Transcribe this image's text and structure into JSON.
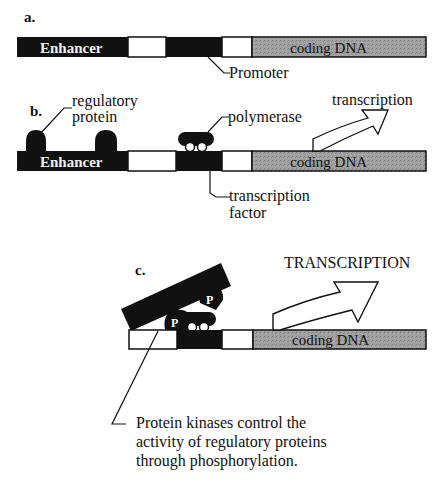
{
  "colors": {
    "dark": "#111111",
    "coding_gray": "#9a9a9a",
    "white": "#ffffff"
  },
  "panel_a": {
    "caption": "a.",
    "enhancer_label": "Enhancer",
    "coding_label": "coding DNA",
    "promoter_label": "Promoter"
  },
  "panel_b": {
    "caption": "b.",
    "regulatory_protein_label_1": "regulatory",
    "regulatory_protein_label_2": "protein",
    "polymerase_label": "polymerase",
    "transcription_label": "transcription",
    "enhancer_label": "Enhancer",
    "coding_label": "coding DNA",
    "tf_label_1": "transcription",
    "tf_label_2": "factor"
  },
  "panel_c": {
    "caption": "c.",
    "transcription_label": "TRANSCRIPTION",
    "phospho_1": "P",
    "phospho_2": "P",
    "coding_label": "coding DNA",
    "note_line_1": "Protein kinases control the",
    "note_line_2": "activity of regulatory proteins",
    "note_line_3": "through phosphorylation."
  }
}
